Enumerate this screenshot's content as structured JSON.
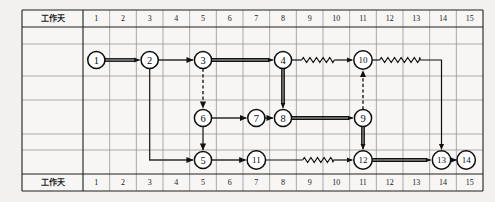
{
  "diagram": {
    "row_label_top": "工作天",
    "row_label_bottom": "工作天",
    "day_columns": [
      "1",
      "2",
      "3",
      "4",
      "5",
      "6",
      "7",
      "8",
      "9",
      "10",
      "11",
      "12",
      "13",
      "14",
      "15"
    ],
    "colors": {
      "background": "#f2f1ef",
      "grid": "#8a8a8a",
      "frame": "#1f1f1f",
      "node_stroke": "#0d0d0d",
      "node_fill": "#ffffff",
      "edge": "#111111"
    },
    "nodes": [
      {
        "id": "n1",
        "label": "1",
        "day": 1,
        "row": "top"
      },
      {
        "id": "n2",
        "label": "2",
        "day": 3,
        "row": "top"
      },
      {
        "id": "n3",
        "label": "3",
        "day": 5,
        "row": "top"
      },
      {
        "id": "n4",
        "label": "4",
        "day": 8,
        "row": "top"
      },
      {
        "id": "n10",
        "label": "10",
        "day": 11,
        "row": "top"
      },
      {
        "id": "n6",
        "label": "6",
        "day": 5,
        "row": "middle"
      },
      {
        "id": "n7",
        "label": "7",
        "day": 7,
        "row": "middle"
      },
      {
        "id": "n8",
        "label": "8",
        "day": 8,
        "row": "middle"
      },
      {
        "id": "n9",
        "label": "9",
        "day": 11,
        "row": "middle"
      },
      {
        "id": "n5",
        "label": "5",
        "day": 5,
        "row": "bottom"
      },
      {
        "id": "n11",
        "label": "11",
        "day": 7,
        "row": "bottom"
      },
      {
        "id": "n12",
        "label": "12",
        "day": 11,
        "row": "bottom"
      },
      {
        "id": "n13",
        "label": "13",
        "day": 14,
        "row": "bottom"
      },
      {
        "id": "n14",
        "label": "14",
        "day": 15,
        "row": "bottom"
      }
    ],
    "edges": [
      {
        "from": "1",
        "to": "2",
        "style": "double",
        "note": "critical-path"
      },
      {
        "from": "2",
        "to": "3",
        "style": "single",
        "note": ""
      },
      {
        "from": "3",
        "to": "4",
        "style": "double",
        "note": "critical-path"
      },
      {
        "from": "4",
        "to": "10",
        "style": "wavy",
        "note": "float"
      },
      {
        "from": "10",
        "to": "13",
        "style": "wavy",
        "note": "float"
      },
      {
        "from": "3",
        "to": "6",
        "style": "dashed",
        "note": "dummy"
      },
      {
        "from": "6",
        "to": "7",
        "style": "single",
        "note": ""
      },
      {
        "from": "7",
        "to": "8",
        "style": "single",
        "note": ""
      },
      {
        "from": "8",
        "to": "9",
        "style": "double",
        "note": "critical-path"
      },
      {
        "from": "4",
        "to": "8",
        "style": "double",
        "note": "critical-path"
      },
      {
        "from": "9",
        "to": "10",
        "style": "dashed",
        "note": "dummy"
      },
      {
        "from": "9",
        "to": "12",
        "style": "double",
        "note": "critical-path"
      },
      {
        "from": "2",
        "to": "5",
        "style": "single",
        "note": ""
      },
      {
        "from": "6",
        "to": "5",
        "style": "single",
        "note": ""
      },
      {
        "from": "5",
        "to": "11",
        "style": "single",
        "note": ""
      },
      {
        "from": "11",
        "to": "12",
        "style": "wavy",
        "note": "float"
      },
      {
        "from": "12",
        "to": "13",
        "style": "double",
        "note": "critical-path"
      },
      {
        "from": "13",
        "to": "14",
        "style": "single",
        "note": ""
      }
    ]
  }
}
